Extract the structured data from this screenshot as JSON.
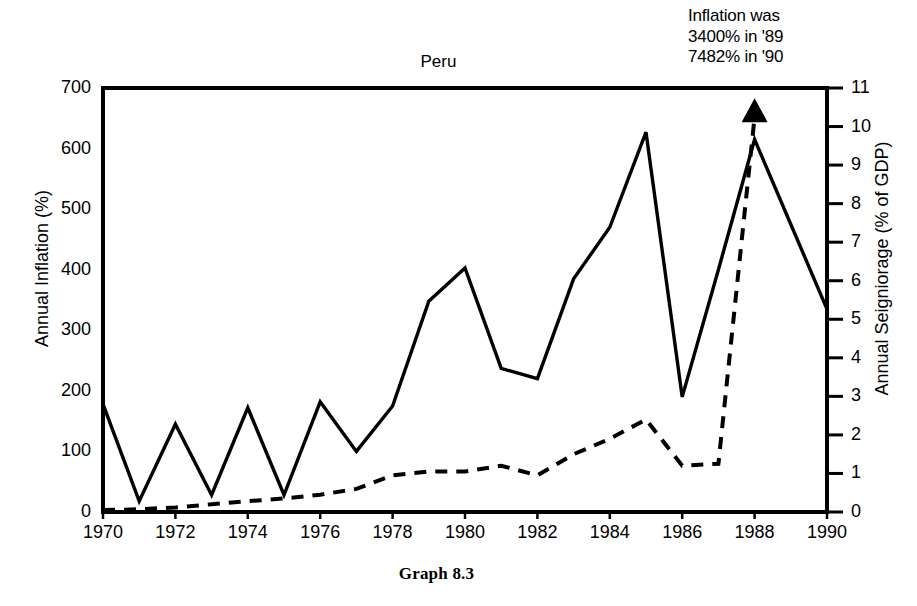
{
  "caption": "Graph 8.3",
  "annotation": {
    "line1": "Inflation was",
    "line2": "3400% in '89",
    "line3": "7482% in '90"
  },
  "chart_data": {
    "type": "line",
    "title": "Peru",
    "xlabel": "",
    "ylabel": "Annual Inflation (%)",
    "y2label": "Annual Seigniorage (% of GDP)",
    "xlim": [
      1970,
      1990
    ],
    "ylim": [
      0,
      700
    ],
    "y2lim": [
      0,
      11
    ],
    "grid": false,
    "legend": "none",
    "xticks": [
      1970,
      1972,
      1974,
      1976,
      1978,
      1980,
      1982,
      1984,
      1986,
      1988,
      1990
    ],
    "yticks": [
      0,
      100,
      200,
      300,
      400,
      500,
      600,
      700
    ],
    "y2ticks": [
      0,
      1,
      2,
      3,
      4,
      5,
      6,
      7,
      8,
      9,
      10,
      11
    ],
    "x": [
      1970,
      1971,
      1972,
      1973,
      1974,
      1975,
      1976,
      1977,
      1978,
      1979,
      1980,
      1981,
      1982,
      1983,
      1984,
      1985,
      1986,
      1987,
      1988,
      1989,
      1990
    ],
    "series": [
      {
        "name": "Annual Inflation (%)",
        "axis": "left",
        "style": "solid",
        "values": [
          178,
          18,
          145,
          28,
          172,
          28,
          182,
          100,
          175,
          348,
          403,
          237,
          220,
          385,
          470,
          627,
          190,
          400,
          615,
          null,
          335
        ]
      },
      {
        "name": "Annual Seigniorage (% of GDP)",
        "axis": "right",
        "style": "dashed",
        "values": [
          0.05,
          0.07,
          0.12,
          0.2,
          0.28,
          0.35,
          0.45,
          0.6,
          0.95,
          1.05,
          1.05,
          1.2,
          0.95,
          1.5,
          1.9,
          2.4,
          1.2,
          1.25,
          10.25,
          null,
          null
        ]
      }
    ],
    "annotations": [
      {
        "name": "off-scale-arrow",
        "type": "arrowhead-up",
        "x": 1988,
        "note": "marker above 1988 indicating values continue off-scale"
      },
      {
        "name": "inflation-note",
        "type": "text",
        "text": "Inflation was 3400% in '89 7482% in '90"
      }
    ]
  }
}
